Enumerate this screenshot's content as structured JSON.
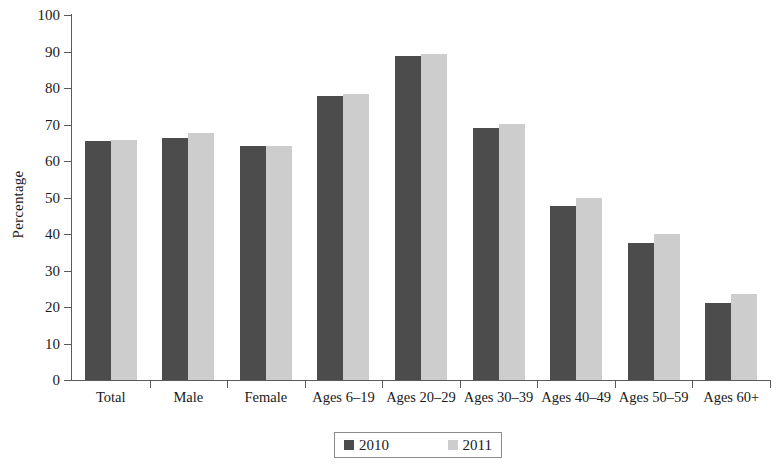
{
  "chart_data": {
    "type": "bar",
    "title": "",
    "subtitle": "",
    "xlabel": "",
    "ylabel": "Percentage",
    "ylim": [
      0,
      100
    ],
    "ytick_step": 10,
    "yticks": [
      0,
      10,
      20,
      30,
      40,
      50,
      60,
      70,
      80,
      90,
      100
    ],
    "ytick_labels": [
      "0",
      "10",
      "20",
      "30",
      "40",
      "50",
      "60",
      "70",
      "80",
      "90",
      "100"
    ],
    "grid": false,
    "legend_position": "bottom",
    "categories": [
      "Total",
      "Male",
      "Female",
      "Ages 6–19",
      "Ages 20–29",
      "Ages 30–39",
      "Ages 40–49",
      "Ages 50–59",
      "Ages 60+"
    ],
    "series": [
      {
        "name": "2010",
        "color": "#4c4c4c",
        "values": [
          65.5,
          66.4,
          64.2,
          77.8,
          88.8,
          69.0,
          47.6,
          37.5,
          21.0
        ]
      },
      {
        "name": "2011",
        "color": "#cdcdcd",
        "values": [
          65.7,
          67.6,
          64.2,
          78.4,
          89.2,
          70.2,
          49.8,
          39.9,
          23.5
        ]
      }
    ]
  },
  "legend": {
    "entries": [
      {
        "label": "2010",
        "swatch": "dark-gray-square"
      },
      {
        "label": "2011",
        "swatch": "light-gray-square"
      }
    ]
  },
  "colors": {
    "series_2010": "#4c4c4c",
    "series_2011": "#cdcdcd",
    "axis": "#5a5a5a",
    "text": "#1a1a1a",
    "background": "#ffffff"
  }
}
